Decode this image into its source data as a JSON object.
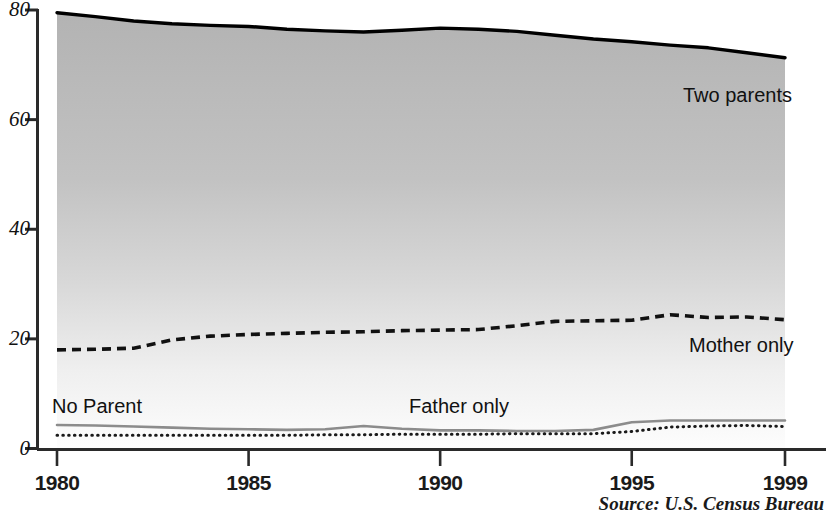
{
  "chart_data": {
    "type": "area",
    "title": "",
    "subtitle": "",
    "xlabel": "",
    "ylabel": "",
    "xlim": [
      1980,
      1999
    ],
    "ylim": [
      0,
      80
    ],
    "grid": false,
    "legend_position": "inline-annotations",
    "x": [
      1980,
      1981,
      1982,
      1983,
      1984,
      1985,
      1986,
      1987,
      1988,
      1989,
      1990,
      1991,
      1992,
      1993,
      1994,
      1995,
      1996,
      1997,
      1998,
      1999
    ],
    "y_ticks": [
      0,
      20,
      40,
      60,
      80
    ],
    "x_ticks": [
      1980,
      1985,
      1990,
      1995,
      1999
    ],
    "x_tick_labels": [
      "1980",
      "1985",
      "1990",
      "1995",
      "1999"
    ],
    "y_tick_labels": [
      "0",
      "20",
      "40",
      "60",
      "80"
    ],
    "series": [
      {
        "name": "Two parents",
        "style": "solid-thick-black-filled-area",
        "color": "#000000",
        "fill": "gradient-gray-to-white",
        "values": [
          79.5,
          78.8,
          78.0,
          77.5,
          77.2,
          77.0,
          76.5,
          76.2,
          76.0,
          76.3,
          76.7,
          76.5,
          76.1,
          75.4,
          74.7,
          74.2,
          73.6,
          73.1,
          72.2,
          71.3
        ]
      },
      {
        "name": "Mother only",
        "style": "dashed-black",
        "color": "#111111",
        "values": [
          18.0,
          18.1,
          18.3,
          19.8,
          20.5,
          20.8,
          21.0,
          21.2,
          21.3,
          21.5,
          21.6,
          21.7,
          22.4,
          23.2,
          23.3,
          23.4,
          24.4,
          23.9,
          24.0,
          23.5
        ]
      },
      {
        "name": "Father only",
        "style": "solid-gray",
        "color": "#8c8c8c",
        "values": [
          4.3,
          4.2,
          4.0,
          3.8,
          3.6,
          3.5,
          3.4,
          3.5,
          4.1,
          3.6,
          3.3,
          3.3,
          3.2,
          3.2,
          3.4,
          4.8,
          5.1,
          5.1,
          5.1,
          5.1
        ]
      },
      {
        "name": "No Parent",
        "style": "dotted-black",
        "color": "#1a1a1a",
        "values": [
          2.4,
          2.4,
          2.4,
          2.4,
          2.4,
          2.4,
          2.4,
          2.5,
          2.5,
          2.6,
          2.6,
          2.6,
          2.7,
          2.7,
          2.7,
          3.1,
          3.9,
          4.1,
          4.2,
          4.0
        ]
      }
    ],
    "annotations": [
      {
        "text": "Two parents",
        "x_px": 683,
        "y_px": 85
      },
      {
        "text": "Mother only",
        "x_px": 689,
        "y_px": 335
      },
      {
        "text": "No Parent",
        "x_px": 52,
        "y_px": 396
      },
      {
        "text": "Father only",
        "x_px": 409,
        "y_px": 396
      }
    ],
    "source": "Source: U.S. Census Bureau",
    "colors": {
      "area_fill_top": "#b5b5b5",
      "area_fill_bottom": "#fdfdfd",
      "axis": "#2a2a2a",
      "two_parents_line": "#000000",
      "mother_only_line": "#111111",
      "father_only_line": "#8c8c8c",
      "no_parent_line": "#1a1a1a"
    }
  }
}
